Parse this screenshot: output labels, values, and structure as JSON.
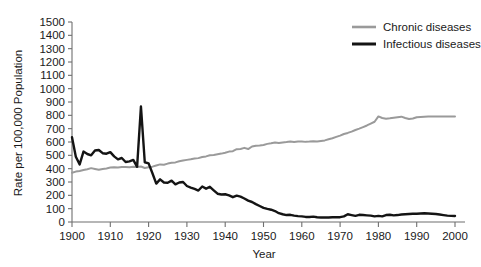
{
  "chart_data": {
    "type": "line",
    "title": "",
    "xlabel": "Year",
    "ylabel": "Rate per 100,000 Population",
    "xlim": [
      1900,
      2000
    ],
    "ylim": [
      0,
      1500
    ],
    "xticks": [
      1900,
      1910,
      1920,
      1930,
      1940,
      1950,
      1960,
      1970,
      1980,
      1990,
      2000
    ],
    "yticks": [
      0,
      100,
      200,
      300,
      400,
      500,
      600,
      700,
      800,
      900,
      1000,
      1100,
      1200,
      1300,
      1400,
      1500
    ],
    "grid": false,
    "legend_position": "top-right",
    "series": [
      {
        "name": "Chronic diseases",
        "color": "#9a9a9a",
        "x": [
          1900,
          1901,
          1902,
          1903,
          1904,
          1905,
          1906,
          1907,
          1908,
          1909,
          1910,
          1911,
          1912,
          1913,
          1914,
          1915,
          1916,
          1917,
          1918,
          1919,
          1920,
          1921,
          1922,
          1923,
          1924,
          1925,
          1926,
          1927,
          1928,
          1929,
          1930,
          1931,
          1932,
          1933,
          1934,
          1935,
          1936,
          1937,
          1938,
          1939,
          1940,
          1941,
          1942,
          1943,
          1944,
          1945,
          1946,
          1947,
          1948,
          1949,
          1950,
          1951,
          1952,
          1953,
          1954,
          1955,
          1956,
          1957,
          1958,
          1959,
          1960,
          1961,
          1962,
          1963,
          1964,
          1965,
          1966,
          1967,
          1968,
          1969,
          1970,
          1971,
          1972,
          1973,
          1974,
          1975,
          1976,
          1977,
          1978,
          1979,
          1980,
          1981,
          1982,
          1983,
          1984,
          1985,
          1986,
          1987,
          1988,
          1989,
          1990,
          1991,
          1992,
          1993,
          1994,
          1995,
          1996,
          1997,
          1998,
          1999,
          2000
        ],
        "values": [
          370,
          378,
          383,
          390,
          396,
          404,
          398,
          392,
          398,
          402,
          408,
          410,
          409,
          412,
          412,
          411,
          414,
          412,
          416,
          405,
          411,
          415,
          424,
          432,
          430,
          438,
          444,
          447,
          455,
          461,
          466,
          470,
          476,
          479,
          488,
          492,
          500,
          503,
          508,
          513,
          520,
          528,
          531,
          546,
          548,
          556,
          547,
          566,
          572,
          574,
          578,
          586,
          590,
          596,
          592,
          597,
          600,
          604,
          600,
          603,
          604,
          601,
          603,
          606,
          604,
          608,
          612,
          620,
          628,
          638,
          648,
          660,
          668,
          678,
          690,
          700,
          712,
          724,
          738,
          752,
          792,
          780,
          775,
          778,
          782,
          786,
          790,
          780,
          772,
          776,
          786,
          788,
          790,
          792,
          792,
          792,
          792,
          792,
          792,
          792,
          792
        ]
      },
      {
        "name": "Infectious diseases",
        "color": "#141414",
        "x": [
          1900,
          1901,
          1902,
          1903,
          1904,
          1905,
          1906,
          1907,
          1908,
          1909,
          1910,
          1911,
          1912,
          1913,
          1914,
          1915,
          1916,
          1917,
          1918,
          1919,
          1920,
          1921,
          1922,
          1923,
          1924,
          1925,
          1926,
          1927,
          1928,
          1929,
          1930,
          1931,
          1932,
          1933,
          1934,
          1935,
          1936,
          1937,
          1938,
          1939,
          1940,
          1941,
          1942,
          1943,
          1944,
          1945,
          1946,
          1947,
          1948,
          1949,
          1950,
          1951,
          1952,
          1953,
          1954,
          1955,
          1956,
          1957,
          1958,
          1959,
          1960,
          1961,
          1962,
          1963,
          1964,
          1965,
          1966,
          1967,
          1968,
          1969,
          1970,
          1971,
          1972,
          1973,
          1974,
          1975,
          1976,
          1977,
          1978,
          1979,
          1980,
          1981,
          1982,
          1983,
          1984,
          1985,
          1986,
          1987,
          1988,
          1989,
          1990,
          1991,
          1992,
          1993,
          1994,
          1995,
          1996,
          1997,
          1998,
          1999,
          2000
        ],
        "values": [
          636,
          490,
          432,
          528,
          510,
          500,
          536,
          540,
          516,
          512,
          524,
          492,
          470,
          480,
          450,
          455,
          466,
          414,
          866,
          448,
          440,
          366,
          288,
          320,
          296,
          294,
          310,
          282,
          296,
          300,
          270,
          258,
          248,
          236,
          266,
          250,
          264,
          238,
          212,
          206,
          208,
          200,
          186,
          198,
          190,
          176,
          160,
          150,
          134,
          120,
          106,
          98,
          92,
          82,
          66,
          58,
          52,
          54,
          48,
          44,
          42,
          38,
          38,
          40,
          36,
          34,
          34,
          34,
          36,
          36,
          36,
          42,
          58,
          52,
          46,
          54,
          52,
          50,
          48,
          42,
          46,
          42,
          52,
          54,
          50,
          52,
          56,
          58,
          60,
          62,
          62,
          64,
          66,
          64,
          62,
          60,
          56,
          52,
          48,
          46,
          45
        ]
      }
    ]
  },
  "legend": {
    "items": [
      {
        "label": "Chronic diseases",
        "color": "#9a9a9a"
      },
      {
        "label": "Infectious diseases",
        "color": "#141414"
      }
    ]
  },
  "axes": {
    "y_title": "Rate per 100,000 Population",
    "x_title": "Year",
    "y_tick_labels": [
      "1500",
      "1400",
      "1300",
      "1200",
      "1100",
      "1000",
      "900",
      "800",
      "700",
      "600",
      "500",
      "400",
      "300",
      "200",
      "100",
      "0"
    ],
    "x_tick_labels": [
      "1900",
      "1910",
      "1920",
      "1930",
      "1940",
      "1950",
      "1960",
      "1970",
      "1980",
      "1990",
      "2000"
    ]
  }
}
